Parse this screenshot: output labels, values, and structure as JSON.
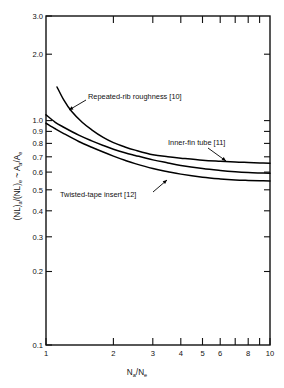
{
  "chart_data": {
    "type": "line",
    "title": "",
    "subtitle": "",
    "xlabel": "Na/Ne",
    "ylabel": "(NL)a/(NL)e ~ Aa/Ae",
    "xscale": "log",
    "yscale": "log",
    "xlim": [
      1,
      10
    ],
    "ylim": [
      0.1,
      3.0
    ],
    "grid": false,
    "legend_position": "inline-annotations",
    "xticks": [
      1,
      2,
      3,
      4,
      5,
      6,
      8,
      10
    ],
    "xtick_labels": [
      "1",
      "2",
      "3",
      "4",
      "5",
      "6",
      "8",
      "10"
    ],
    "xticks_minor": [
      7,
      9
    ],
    "yticks": [
      0.1,
      0.2,
      0.3,
      0.4,
      0.5,
      0.6,
      0.7,
      0.8,
      0.9,
      1.0,
      2.0,
      3.0
    ],
    "ytick_labels": [
      "0.1",
      "0.2",
      "0.3",
      "0.4",
      "0.5",
      "0.6",
      "0.7",
      "0.8",
      "0.9",
      "1.0",
      "2.0",
      "3.0"
    ],
    "series": [
      {
        "name": "Repeated-rib roughness [10]",
        "reference": "[10]",
        "x": [
          1.12,
          1.2,
          1.3,
          1.45,
          1.6,
          1.8,
          2.0,
          2.25,
          2.5,
          3.0,
          3.5,
          4.0,
          5.0,
          6.0,
          7.0,
          8.0,
          9.0,
          10.0
        ],
        "y": [
          1.44,
          1.26,
          1.12,
          1.0,
          0.925,
          0.855,
          0.81,
          0.775,
          0.75,
          0.715,
          0.7,
          0.69,
          0.675,
          0.668,
          0.663,
          0.66,
          0.657,
          0.655
        ]
      },
      {
        "name": "Inner-fin tube [11]",
        "reference": "[11]",
        "x": [
          1.0,
          1.1,
          1.2,
          1.4,
          1.6,
          1.8,
          2.0,
          2.25,
          2.5,
          3.0,
          3.5,
          4.0,
          5.0,
          6.0,
          7.0,
          8.0,
          9.0,
          10.0
        ],
        "y": [
          1.08,
          1.0,
          0.95,
          0.875,
          0.825,
          0.787,
          0.757,
          0.73,
          0.71,
          0.678,
          0.657,
          0.64,
          0.62,
          0.608,
          0.6,
          0.595,
          0.592,
          0.59
        ]
      },
      {
        "name": "Twisted-tape insert [12]",
        "reference": "[12]",
        "x": [
          1.0,
          1.1,
          1.2,
          1.4,
          1.6,
          1.8,
          2.0,
          2.25,
          2.5,
          3.0,
          3.5,
          4.0,
          5.0,
          6.0,
          7.0,
          8.0,
          9.0,
          10.0
        ],
        "y": [
          0.99,
          0.935,
          0.89,
          0.82,
          0.772,
          0.735,
          0.705,
          0.675,
          0.652,
          0.62,
          0.6,
          0.585,
          0.567,
          0.557,
          0.551,
          0.548,
          0.546,
          0.545
        ]
      }
    ],
    "annotations": [
      {
        "text": "Repeated-rib roughness [10]",
        "series": "Repeated-rib roughness [10]",
        "text_x_px": 88,
        "text_y_px": 99,
        "arrow_from_px": [
          86,
          100
        ],
        "arrow_to_px": [
          69,
          110
        ]
      },
      {
        "text": "Inner-fin tube [11]",
        "series": "Inner-fin tube [11]",
        "text_x_px": 168,
        "text_y_px": 145,
        "arrow_from_px": [
          208,
          148
        ],
        "arrow_to_px": [
          226,
          161
        ]
      },
      {
        "text": "Twisted-tape insert [12]",
        "series": "Twisted-tape insert [12]",
        "text_x_px": 60,
        "text_y_px": 197,
        "arrow_from_px": [
          153,
          192
        ],
        "arrow_to_px": [
          167,
          180
        ]
      }
    ]
  },
  "axis_titles": {
    "y_main": "(NL)",
    "y_sub_a": "a",
    "y_mid": "/(NL)",
    "y_sub_e": "e",
    "y_tilde": " ~ A",
    "y_sub_a2": "a",
    "y_slash": "/A",
    "y_sub_e2": "e",
    "x_main": "N",
    "x_sub_a": "a",
    "x_slash": "/N",
    "x_sub_e": "e"
  },
  "colors": {
    "axis": "#111111",
    "curve": "#000000",
    "background": "#ffffff"
  }
}
